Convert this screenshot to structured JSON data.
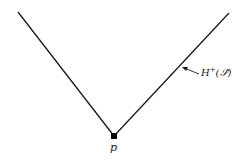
{
  "diagram": {
    "type": "light-cone boundary (future Cauchy horizon)",
    "point_label": "p",
    "horizon_label": "H⁺(𝒮̂)",
    "horizon_label_parts": {
      "base": "H",
      "sup": "+",
      "arg": "(𝒮̂)"
    },
    "line_color": "#1a1a1a"
  }
}
